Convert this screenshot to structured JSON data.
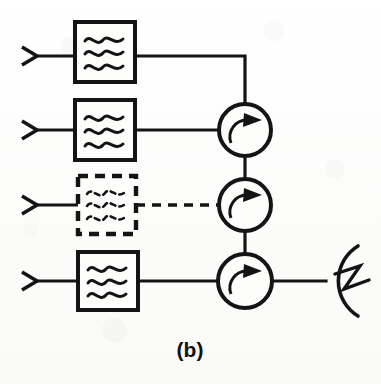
{
  "figure": {
    "caption": "(b)",
    "caption_x": 190,
    "caption_y": 357,
    "type": "rf-block-diagram",
    "colors": {
      "ink": "#141414",
      "paper": "#fdfdfc"
    }
  },
  "canvas": {
    "width": 381,
    "height": 384
  },
  "channels": [
    {
      "id": "channel-1",
      "label": "Channel 1",
      "input_connector": {
        "x": 22,
        "y": 56,
        "size": 15
      },
      "input_wire": {
        "x1": 37,
        "y1": 56,
        "x2": 75,
        "y2": 56
      },
      "filter": {
        "x": 75,
        "y": 22,
        "w": 60,
        "h": 60,
        "style": "solid",
        "waves": 3,
        "name": "bandpass-filter"
      },
      "output_wire": {
        "x1": 135,
        "y1": 56,
        "x2": 245,
        "y2": 56
      },
      "drop_wire": {
        "x1": 245,
        "y1": 56,
        "x2": 245,
        "y2": 104
      },
      "dashed": false
    },
    {
      "id": "channel-2",
      "label": "Channel 2",
      "input_connector": {
        "x": 22,
        "y": 130,
        "size": 15
      },
      "input_wire": {
        "x1": 37,
        "y1": 130,
        "x2": 75,
        "y2": 130
      },
      "filter": {
        "x": 75,
        "y": 100,
        "w": 60,
        "h": 60,
        "style": "solid",
        "waves": 3,
        "name": "bandpass-filter"
      },
      "output_wire": {
        "x1": 135,
        "y1": 130,
        "x2": 219,
        "y2": 130
      },
      "dashed": false
    },
    {
      "id": "channel-3",
      "label": "Channel 3 (future / optional)",
      "input_connector": {
        "x": 22,
        "y": 205,
        "size": 15
      },
      "input_wire": {
        "x1": 37,
        "y1": 205,
        "x2": 78,
        "y2": 205
      },
      "filter": {
        "x": 78,
        "y": 176,
        "w": 58,
        "h": 58,
        "style": "dashed",
        "waves": 3,
        "name": "bandpass-filter-optional"
      },
      "output_wire": {
        "x1": 136,
        "y1": 205,
        "x2": 219,
        "y2": 205
      },
      "dashed": true
    },
    {
      "id": "channel-4",
      "label": "Channel 4",
      "input_connector": {
        "x": 22,
        "y": 281,
        "size": 15
      },
      "input_wire": {
        "x1": 37,
        "y1": 281,
        "x2": 78,
        "y2": 281
      },
      "filter": {
        "x": 78,
        "y": 252,
        "w": 60,
        "h": 58,
        "style": "solid",
        "waves": 3,
        "name": "bandpass-filter"
      },
      "output_wire": {
        "x1": 138,
        "y1": 281,
        "x2": 219,
        "y2": 281
      },
      "dashed": false
    }
  ],
  "circulators": [
    {
      "id": "circulator-1",
      "label": "Circulator 1",
      "cx": 245,
      "cy": 130,
      "r": 26,
      "rotation": "clockwise"
    },
    {
      "id": "circulator-2",
      "label": "Circulator 2",
      "cx": 245,
      "cy": 205,
      "r": 26,
      "rotation": "clockwise"
    },
    {
      "id": "circulator-3",
      "label": "Circulator 3",
      "cx": 245,
      "cy": 281,
      "r": 27,
      "rotation": "clockwise"
    }
  ],
  "interconnects": [
    {
      "id": "circ1-to-circ2",
      "x1": 245,
      "y1": 156,
      "x2": 245,
      "y2": 179
    },
    {
      "id": "circ2-to-circ3",
      "x1": 245,
      "y1": 231,
      "x2": 245,
      "y2": 254
    }
  ],
  "antenna": {
    "id": "antenna",
    "label": "Antenna",
    "feed_wire": {
      "x1": 272,
      "y1": 281,
      "x2": 325,
      "y2": 281
    },
    "arc": {
      "cx": 330,
      "cy": 281,
      "r": 41
    },
    "bolt": {
      "points": "337,272 360,266 345,288 368,280"
    }
  }
}
